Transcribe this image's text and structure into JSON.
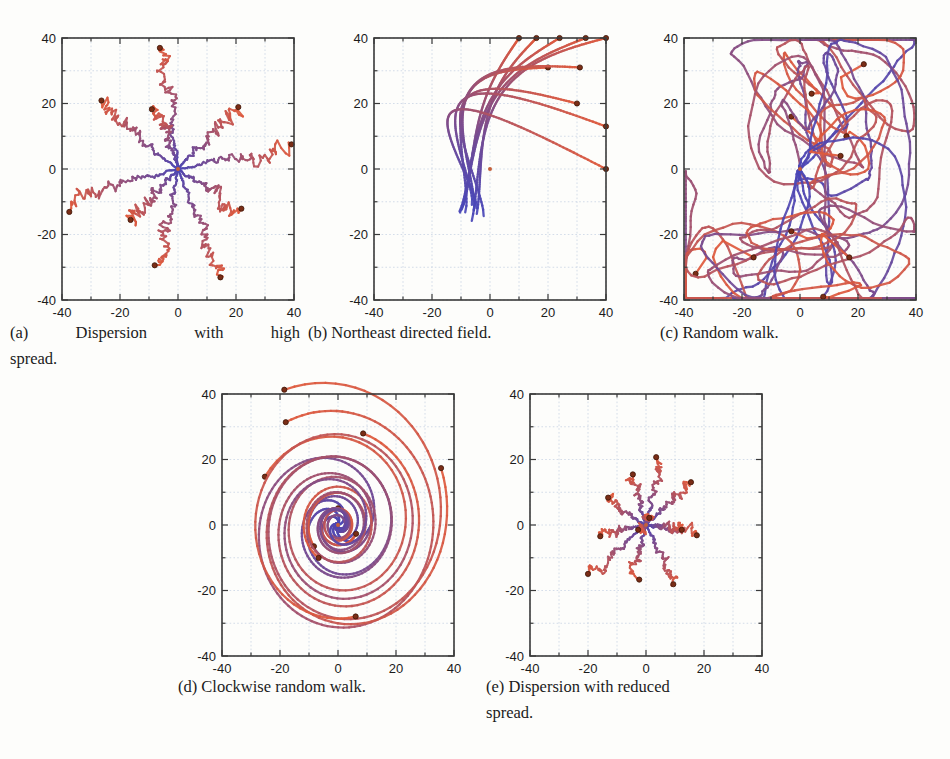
{
  "figure": {
    "panel_count": 5,
    "axis": {
      "xlabel": "",
      "ylabel": "",
      "xlim": [
        -40,
        40
      ],
      "ylim": [
        -40,
        40
      ],
      "xticks": [
        -40,
        -20,
        0,
        20,
        40
      ],
      "yticks": [
        -40,
        -20,
        0,
        20,
        40
      ],
      "xtick_labels": [
        "-40",
        "-20",
        "0",
        "20",
        "40"
      ],
      "ytick_labels": [
        "-40",
        "-20",
        "0",
        "20",
        "40"
      ],
      "minor_tick_step": 10,
      "grid": true,
      "grid_color": "#c9d4e4",
      "frame_color": "#3a3a3a",
      "tick_font_size": 13
    },
    "style": {
      "start_color": "#4a47b8",
      "end_color": "#e05a3c",
      "marker_color": "#7a2d16",
      "marker_edge": "#3d1608",
      "background": "#fdfdfb"
    },
    "captions": [
      {
        "tag": "(a)",
        "text": "Dispersion with high spread."
      },
      {
        "tag": "(b)",
        "text": "Northeast directed field."
      },
      {
        "tag": "(c)",
        "text": "Random walk."
      },
      {
        "tag": "(d)",
        "text": "Clockwise random walk."
      },
      {
        "tag": "(e)",
        "text": "Dispersion with reduced spread."
      }
    ],
    "caption_lines": {
      "a_line1": "(a)  Dispersion  with  high",
      "a_line2": "spread.",
      "b_line1": "(b) Northeast directed field.",
      "c_line1": "(c) Random walk.",
      "d_line1": "(d) Clockwise random walk.",
      "e_line1": "(e) Dispersion with reduced",
      "e_line2": "spread."
    }
  },
  "chart_data": [
    {
      "id": "a",
      "type": "line",
      "title": "Dispersion with high spread",
      "xlabel": "",
      "ylabel": "",
      "xlim": [
        -40,
        40
      ],
      "ylim": [
        -40,
        40
      ],
      "grid": true,
      "legend": "none",
      "description": "Ten noisy radial trajectories emanating from the origin, each ending in a dark marker dot; jagged small-scale noise superposed on straight radial drift.",
      "n_trajectories": 10,
      "origin": [
        0,
        0
      ],
      "noise_amplitude": 1.6,
      "endpoints": [
        [
          -5,
          37
        ],
        [
          -27,
          20
        ],
        [
          -7,
          19
        ],
        [
          20,
          18
        ],
        [
          38,
          6
        ],
        [
          -38,
          -10
        ],
        [
          21,
          -12
        ],
        [
          -17,
          -15
        ],
        [
          -6,
          -29
        ],
        [
          15,
          -33
        ]
      ]
    },
    {
      "id": "b",
      "type": "line",
      "title": "Northeast directed field",
      "xlabel": "",
      "ylabel": "",
      "xlim": [
        -40,
        40
      ],
      "ylim": [
        -40,
        40
      ],
      "grid": true,
      "legend": "none",
      "description": "Smooth trajectories from near the origin curving up and to the right, saturating against the top (y=40) and right (x=40) boundaries.",
      "n_trajectories": 10,
      "origin": [
        0,
        0
      ],
      "endpoints": [
        [
          10,
          40
        ],
        [
          16,
          40
        ],
        [
          24,
          40
        ],
        [
          33,
          40
        ],
        [
          40,
          40
        ],
        [
          20,
          31
        ],
        [
          31,
          31
        ],
        [
          30,
          20
        ],
        [
          40,
          13
        ],
        [
          40,
          0
        ]
      ]
    },
    {
      "id": "c",
      "type": "line",
      "title": "Random walk",
      "xlabel": "",
      "ylabel": "",
      "xlim": [
        -40,
        40
      ],
      "ylim": [
        -40,
        40
      ],
      "grid": true,
      "legend": "none",
      "description": "Meandering, strongly curved random-walk paths filling the square, all starting near the origin and ending in dark marker dots.",
      "n_trajectories": 10,
      "origin": [
        0,
        0
      ],
      "endpoints": [
        [
          22,
          32
        ],
        [
          4,
          23
        ],
        [
          -3,
          16
        ],
        [
          16,
          10
        ],
        [
          14,
          4
        ],
        [
          -36,
          -32
        ],
        [
          -16,
          -27
        ],
        [
          -3,
          -19
        ],
        [
          17,
          -27
        ],
        [
          8,
          -39
        ]
      ]
    },
    {
      "id": "d",
      "type": "line",
      "title": "Clockwise random walk",
      "xlabel": "",
      "ylabel": "",
      "xlim": [
        -40,
        40
      ],
      "ylim": [
        -40,
        40
      ],
      "grid": true,
      "legend": "none",
      "description": "Smooth spiralling trajectories that wind clockwise outward from the origin in large loops.",
      "n_trajectories": 10,
      "origin": [
        0,
        0
      ],
      "endpoints": [
        [
          -16,
          40
        ],
        [
          -25,
          34
        ],
        [
          30,
          23
        ],
        [
          8,
          25
        ],
        [
          -25,
          8
        ],
        [
          1,
          6
        ],
        [
          7,
          -4
        ],
        [
          -11,
          -6
        ],
        [
          -10,
          -10
        ],
        [
          0,
          -31
        ]
      ]
    },
    {
      "id": "e",
      "type": "line",
      "title": "Dispersion with reduced spread",
      "xlabel": "",
      "ylabel": "",
      "xlim": [
        -40,
        40
      ],
      "ylim": [
        -40,
        40
      ],
      "grid": true,
      "legend": "none",
      "description": "Same radial dispersion pattern as panel (a) but with roughly half the radial extent, forming a compact star near the origin.",
      "n_trajectories": 12,
      "origin": [
        0,
        0
      ],
      "noise_amplitude": 1.1,
      "endpoints": [
        [
          6,
          20
        ],
        [
          -5,
          16
        ],
        [
          15,
          13
        ],
        [
          -13,
          8
        ],
        [
          17,
          -2
        ],
        [
          -15,
          -3
        ],
        [
          -20,
          -15
        ],
        [
          -5,
          -15
        ],
        [
          11,
          -18
        ],
        [
          12,
          -1
        ],
        [
          -2,
          -1
        ],
        [
          1,
          3
        ]
      ]
    }
  ]
}
